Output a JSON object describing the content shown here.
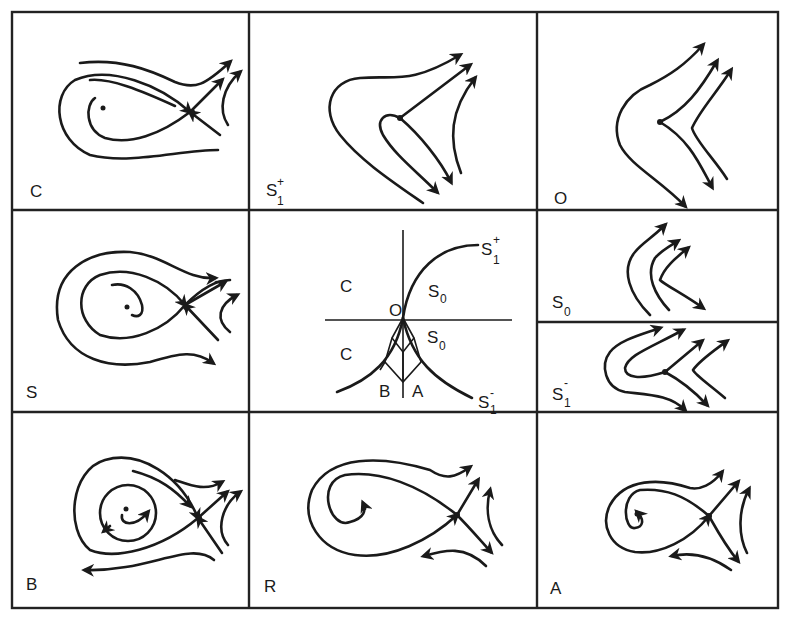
{
  "figure": {
    "panels": [
      {
        "id": "C",
        "label": "C",
        "position": "top-left",
        "content": "focus with spiral, saddle with separatrices"
      },
      {
        "id": "S1plus",
        "label": "S",
        "superscript": "+",
        "subscript": "1",
        "position": "top-middle",
        "content": "saddle-node collapse, trajectories bending"
      },
      {
        "id": "O",
        "label": "O",
        "position": "top-right",
        "content": "degenerate point, trajectories bending"
      },
      {
        "id": "S",
        "label": "S",
        "position": "middle-left",
        "content": "focus with spiral, saddle with separatrices"
      },
      {
        "id": "S0",
        "label": "S",
        "subscript": "0",
        "position": "middle-right-top",
        "content": "flow without equilibria"
      },
      {
        "id": "S1minus",
        "label": "S",
        "superscript": "-",
        "subscript": "1",
        "position": "middle-right-bottom",
        "content": "saddle-node, trajectories bending"
      },
      {
        "id": "B",
        "label": "B",
        "position": "bottom-left",
        "content": "focus with limit cycle and saddle"
      },
      {
        "id": "R",
        "label": "R",
        "position": "bottom-middle",
        "content": "homoclinic loop fish shape"
      },
      {
        "id": "A",
        "label": "A",
        "position": "bottom-right",
        "content": "homoclinic fish shape, smaller"
      }
    ],
    "bifurcation_diagram": {
      "origin_label": "O",
      "region_labels": [
        "C",
        "C",
        "S0",
        "S0",
        "B",
        "A"
      ],
      "curve_labels": [
        {
          "label": "S",
          "superscript": "+",
          "subscript": "1"
        },
        {
          "label": "S",
          "superscript": "-",
          "subscript": "1"
        }
      ]
    }
  },
  "labels": {
    "C": "C",
    "S1p_base": "S",
    "S1p_sup": "+",
    "S1p_sub": "1",
    "O": "O",
    "S": "S",
    "S0_base": "S",
    "S0_sub": "0",
    "S1m_base": "S",
    "S1m_sup": "-",
    "S1m_sub": "1",
    "B": "B",
    "R": "R",
    "A": "A",
    "diag_C1": "C",
    "diag_C2": "C",
    "diag_O": "O",
    "diag_S0a_base": "S",
    "diag_S0a_sub": "0",
    "diag_S0b_base": "S",
    "diag_S0b_sub": "0",
    "diag_B": "B",
    "diag_A": "A",
    "diag_S1p_base": "S",
    "diag_S1p_sup": "+",
    "diag_S1p_sub": "1",
    "diag_S1m_base": "S",
    "diag_S1m_sup": "-",
    "diag_S1m_sub": "1"
  }
}
